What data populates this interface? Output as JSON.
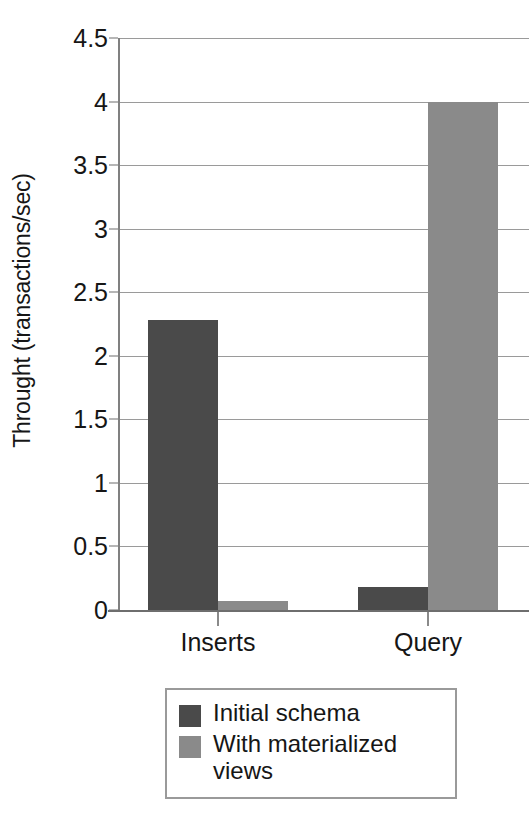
{
  "chart_data": {
    "type": "bar",
    "title": "",
    "xlabel": "",
    "ylabel": "Throught (transactions/sec)",
    "categories": [
      "Inserts",
      "Query"
    ],
    "series": [
      {
        "name": "Initial schema",
        "color": "#4a4a4a",
        "values": [
          2.28,
          0.18
        ]
      },
      {
        "name": "With materialized views",
        "color": "#8a8a8a",
        "values": [
          0.07,
          4.0
        ]
      }
    ],
    "ylim": [
      0,
      4.5
    ],
    "yticks": [
      0,
      0.5,
      1,
      1.5,
      2,
      2.5,
      3,
      3.5,
      4,
      4.5
    ],
    "ytick_labels": [
      "0",
      "0.5",
      "1",
      "1.5",
      "2",
      "2.5",
      "3",
      "3.5",
      "4",
      "4.5"
    ],
    "grid": true,
    "legend_position": "bottom"
  },
  "axis": {
    "y_title": "Throught (transactions/sec)"
  },
  "legend": {
    "entries": [
      {
        "label": "Initial schema",
        "color": "#4a4a4a"
      },
      {
        "label": "With materialized views",
        "color": "#8a8a8a"
      }
    ]
  },
  "colors": {
    "series_dark": "#4a4a4a",
    "series_light": "#8a8a8a",
    "gridline": "#9a9a9a",
    "axis": "#6e6e6e",
    "text": "#161616",
    "background": "#ffffff"
  }
}
